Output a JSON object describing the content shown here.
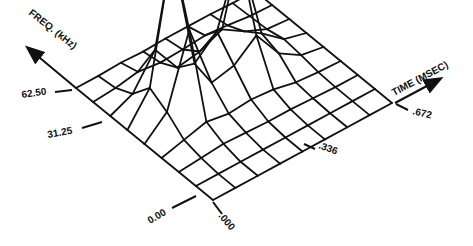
{
  "chart_data": {
    "type": "surface3d",
    "title": "",
    "xlabel": "TIME (MSEC)",
    "ylabel": "FREQ. (kHz)",
    "zlabel": "",
    "x_ticks": [
      ".000",
      ".336",
      ".672"
    ],
    "y_ticks": [
      "0.00",
      "31.25",
      "62.50"
    ],
    "x_range": [
      0.0,
      0.672
    ],
    "y_range": [
      0.0,
      62.5
    ],
    "grid": true,
    "line_color": "#111111",
    "background": "#ffffff",
    "grid_size": {
      "time_steps": 9,
      "freq_steps": 9
    },
    "heights": [
      [
        0,
        0,
        0,
        0,
        0,
        0,
        0,
        0,
        0
      ],
      [
        0,
        0,
        0,
        0,
        0,
        0,
        0,
        0,
        0
      ],
      [
        0,
        2,
        4,
        3,
        2,
        2,
        1,
        0,
        0
      ],
      [
        0,
        6,
        12,
        8,
        10,
        8,
        3,
        1,
        0
      ],
      [
        0,
        20,
        90,
        25,
        30,
        48,
        18,
        4,
        0
      ],
      [
        0,
        30,
        155,
        30,
        50,
        118,
        24,
        6,
        0
      ],
      [
        0,
        10,
        42,
        12,
        16,
        26,
        12,
        2,
        0
      ],
      [
        0,
        2,
        6,
        3,
        4,
        6,
        4,
        1,
        0
      ],
      [
        0,
        0,
        1,
        0,
        1,
        1,
        1,
        0,
        0
      ]
    ],
    "peaks": [
      {
        "label": "peak-1",
        "time_index": 2,
        "freq_index": 5,
        "relative_height": 1.0
      },
      {
        "label": "peak-2",
        "time_index": 5,
        "freq_index": 5,
        "relative_height": 0.76
      },
      {
        "label": "peak-3",
        "time_index": 7,
        "freq_index": 6,
        "relative_height": 0.35
      }
    ]
  },
  "axes": {
    "freq": {
      "label": "FREQ. (kHz)",
      "ticks": [
        {
          "value": "0.00"
        },
        {
          "value": "31.25"
        },
        {
          "value": "62.50"
        }
      ]
    },
    "time": {
      "label": "TIME (MSEC)",
      "ticks": [
        {
          "value": ".000"
        },
        {
          "value": ".336"
        },
        {
          "value": ".672"
        }
      ]
    }
  }
}
